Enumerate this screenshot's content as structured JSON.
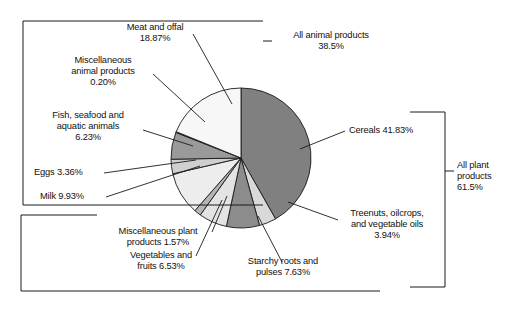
{
  "chart_data": {
    "type": "pie",
    "title": "",
    "unit": "percent",
    "start_angle_deg": 0,
    "direction": "clockwise",
    "legend": "callout-labels",
    "categories": [
      "Cereals",
      "Treenuts, oilcrops, and vegetable oils",
      "Starchy roots and pulses",
      "Vegetables and fruits",
      "Miscellaneous plant products",
      "Milk",
      "Eggs",
      "Fish, seafood and aquatic animals",
      "Miscellaneous animal products",
      "Meat and offal"
    ],
    "values": [
      41.83,
      3.94,
      7.63,
      6.53,
      1.57,
      9.93,
      3.36,
      6.23,
      0.2,
      18.87
    ],
    "colors": [
      "#808080",
      "#d9d9d9",
      "#8c8c8c",
      "#e3e3e3",
      "#b5b5b5",
      "#ededed",
      "#cfcfcf",
      "#9a9a9a",
      "#6e6e6e",
      "#f7f7f7"
    ],
    "groups": [
      {
        "name": "All plant products",
        "value": 61.5,
        "members": [
          "Cereals",
          "Treenuts, oilcrops, and vegetable oils",
          "Starchy roots and pulses",
          "Vegetables and fruits",
          "Miscellaneous plant products"
        ]
      },
      {
        "name": "All animal products",
        "value": 38.5,
        "members": [
          "Milk",
          "Eggs",
          "Fish, seafood and aquatic animals",
          "Miscellaneous animal products",
          "Meat and offal"
        ]
      }
    ]
  },
  "labels": {
    "meat": "Meat and offal\n18.87%",
    "misc_animal": "Miscellaneous\nanimal products\n0.20%",
    "fish": "Fish, seafood and\naquatic animals\n6.23%",
    "eggs": "Eggs 3.36%",
    "milk": "Milk 9.93%",
    "misc_plant": "Miscellaneous plant\nproducts 1.57%",
    "veg_fruit": "Vegetables and\nfruits 6.53%",
    "starchy": "Starchy roots and\npulses 7.63%",
    "treenuts": "Treenuts, oilcrops,\nand vegetable oils\n3.94%",
    "cereals": "Cereals 41.83%",
    "all_animal": "All animal products\n38.5%",
    "all_plant": "All plant\nproducts\n61.5%"
  },
  "style": {
    "stroke": "#1a1a1a",
    "background": "#ffffff"
  }
}
